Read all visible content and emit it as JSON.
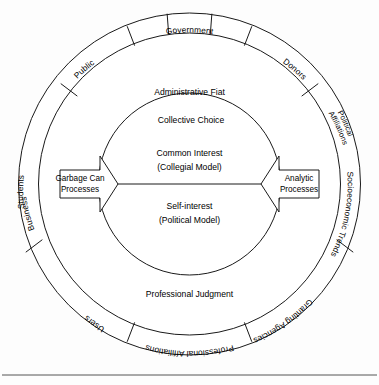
{
  "figure": {
    "title_semantic": "concentric-circles-organizational-decision-model",
    "colors": {
      "stroke": "#1a1a1a",
      "background": "#ffffff",
      "baseline_rule": "#555555"
    },
    "outer_ring": {
      "name": "external-stakeholders-ring",
      "segments": [
        {
          "id": "business",
          "label": "Business",
          "lines": [
            "Business"
          ]
        },
        {
          "id": "public",
          "label": "Public",
          "lines": [
            "Public"
          ]
        },
        {
          "id": "government",
          "label": "Government",
          "lines": [
            "Government"
          ]
        },
        {
          "id": "donors",
          "label": "Donors",
          "lines": [
            "Donors"
          ]
        },
        {
          "id": "political-affiliations",
          "label": "Political Affiliations",
          "lines": [
            "Political",
            "Affiliations"
          ]
        },
        {
          "id": "socioeconomic-trends",
          "label": "Socioeconomic Trends",
          "lines": [
            "Socioeconomic Trends"
          ]
        },
        {
          "id": "granting-agencies",
          "label": "Granting Agencies",
          "lines": [
            "Granting Agencies"
          ]
        },
        {
          "id": "professional-affiliations",
          "label": "Professional Affiliations",
          "lines": [
            "Professional Affiliations"
          ]
        },
        {
          "id": "users",
          "label": "Users",
          "lines": [
            "Users"
          ]
        },
        {
          "id": "students",
          "label": "Students",
          "lines": [
            "Students"
          ]
        }
      ]
    },
    "middle_band": {
      "name": "authority-band",
      "top_label": "Administrative Fiat",
      "bottom_label": "Professional Judgment"
    },
    "inner_circle": {
      "name": "decision-core",
      "boundary_label": "Collective Choice",
      "upper": {
        "line1": "Common Interest",
        "line2": "(Collegial Model)"
      },
      "lower": {
        "line1": "Self-interest",
        "line2": "(Political Model)"
      }
    },
    "arrows": {
      "left": {
        "name": "garbage-can-processes-arrow",
        "line1": "Garbage Can",
        "line2": "Processes",
        "direction": "right"
      },
      "right": {
        "name": "analytic-processes-arrow",
        "line1": "Analytic",
        "line2": "Processes",
        "direction": "left"
      }
    }
  }
}
